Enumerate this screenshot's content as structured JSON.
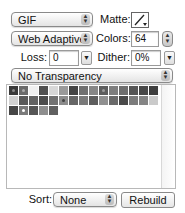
{
  "format": {
    "selected": "GIF"
  },
  "reduction": {
    "selected": "Web Adaptive"
  },
  "matte": {
    "label": "Matte:",
    "icon": "eyedropper-icon"
  },
  "colors": {
    "label": "Colors:",
    "value": "64"
  },
  "loss": {
    "label": "Loss:",
    "value": "0"
  },
  "dither": {
    "label": "Dither:",
    "value": "0%"
  },
  "transparency": {
    "selected": "No Transparency"
  },
  "color_table": {
    "rows": [
      [
        {
          "c": "#3a3a3a",
          "dot": "#888"
        },
        {
          "c": "#6b6b6b",
          "dot": "#aaa"
        },
        {
          "c": "#f0f0f0"
        },
        {
          "c": "#505050"
        },
        {
          "c": "#d8d8d8"
        },
        {
          "c": "#9a9a9a"
        },
        {
          "c": "#444444"
        },
        {
          "c": "#707070"
        },
        {
          "c": "#868686"
        },
        {
          "c": "#5c5c5c",
          "dot": "#999"
        },
        {
          "c": "#7e7e7e"
        },
        {
          "c": "#6e6e6e"
        },
        {
          "c": "#555555"
        },
        {
          "c": "#484848"
        },
        {
          "c": "#3e3e3e"
        }
      ],
      [
        {
          "c": "#d2d2d2"
        },
        {
          "c": "#5a5a5a"
        },
        {
          "c": "#636363"
        },
        {
          "c": "#4c4c4c"
        },
        {
          "c": "#727272"
        },
        {
          "c": "#8c8c8c",
          "dot": "#444"
        },
        {
          "c": "#666666"
        },
        {
          "c": "#7a7a7a"
        },
        {
          "c": "#5e5e5e"
        },
        {
          "c": "#909090"
        },
        {
          "c": "#6a6a6a"
        },
        {
          "c": "#4a4a4a"
        },
        {
          "c": "#7c7c7c"
        },
        {
          "c": "#858585"
        },
        {
          "c": "#cacaca"
        }
      ],
      [
        {
          "c": "#464646"
        },
        {
          "c": "#7a7a7a",
          "dot": "#fff"
        },
        {
          "c": "#565656"
        },
        {
          "c": "#8e8e8e"
        },
        {
          "c": "#606060"
        }
      ]
    ]
  },
  "sort": {
    "label": "Sort:",
    "selected": "None"
  },
  "rebuild_label": "Rebuild"
}
